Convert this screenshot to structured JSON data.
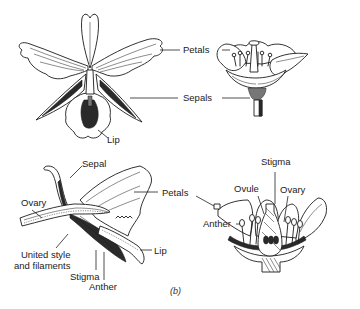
{
  "figure": {
    "caption": "(b)",
    "panels": [
      {
        "id": "orchid-front",
        "subject": "orchid flower, front view",
        "labels": [
          "Petals",
          "Sepals",
          "Lip"
        ]
      },
      {
        "id": "simple-flower-side",
        "subject": "regular flower, side view",
        "labels": [
          "Petals",
          "Sepals"
        ]
      },
      {
        "id": "orchid-section",
        "subject": "orchid flower, longitudinal section",
        "labels": [
          "Sepal",
          "Ovary",
          "Petals",
          "United style\nand filaments",
          "Stigma",
          "Anther",
          "Lip"
        ]
      },
      {
        "id": "simple-flower-section",
        "subject": "regular flower, longitudinal section",
        "labels": [
          "Stigma",
          "Ovule",
          "Ovary",
          "Anther"
        ]
      }
    ]
  },
  "labels": {
    "petals_top": "Petals",
    "sepals_top": "Sepals",
    "lip_top": "Lip",
    "sepal_bottom": "Sepal",
    "ovary_bottom_left": "Ovary",
    "petals_bottom": "Petals",
    "united_style": "United style\nand filaments",
    "stigma_bottom_left": "Stigma",
    "anther_bottom_left": "Anther",
    "lip_bottom": "Lip",
    "stigma_bottom_right": "Stigma",
    "ovule": "Ovule",
    "ovary_bottom_right": "Ovary",
    "anther_bottom_right": "Anther"
  }
}
